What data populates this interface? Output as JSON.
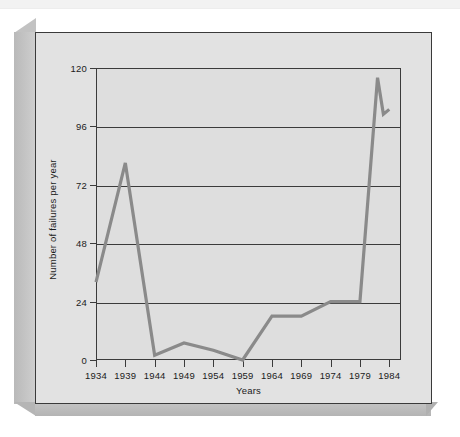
{
  "chart_data": {
    "type": "line",
    "title": "",
    "xlabel": "Years",
    "ylabel": "Number of failures per year",
    "xlim": [
      1934,
      1986
    ],
    "ylim": [
      0,
      120
    ],
    "grid": true,
    "legend": "none",
    "x_tick_labels": [
      "1934",
      "1939",
      "1944",
      "1949",
      "1954",
      "1959",
      "1964",
      "1969",
      "1974",
      "1979",
      "1984"
    ],
    "x_ticks": [
      1934,
      1939,
      1944,
      1949,
      1954,
      1959,
      1964,
      1969,
      1974,
      1979,
      1984
    ],
    "y_tick_labels": [
      "0",
      "24",
      "48",
      "72",
      "96",
      "120"
    ],
    "y_ticks": [
      0,
      24,
      48,
      72,
      96,
      120
    ],
    "series": [
      {
        "name": "Number of failures per year",
        "color": "#8a8a8a",
        "x": [
          1934,
          1939,
          1944,
          1949,
          1954,
          1959,
          1964,
          1969,
          1974,
          1979,
          1982,
          1983,
          1984
        ],
        "values": [
          32,
          81,
          2,
          7,
          4,
          0,
          18,
          18,
          24,
          24,
          116,
          101,
          103
        ]
      }
    ]
  },
  "axes": {
    "y_label": "Number of failures per year",
    "x_label": "Years"
  },
  "colors": {
    "line": "#8a8a8a",
    "axis": "#3b3b3b",
    "plot_background": "#dedede",
    "panel_background": "#e2e2e2",
    "slab_side": "#c2c2c2"
  }
}
